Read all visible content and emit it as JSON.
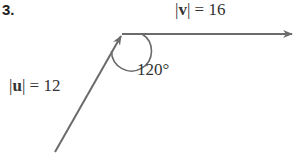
{
  "problem_number": "3.",
  "vectors": {
    "v": {
      "label": "|v| = 16",
      "name": "v",
      "magnitude": "16"
    },
    "u": {
      "label": "|u| = 12",
      "name": "u",
      "magnitude": "12"
    }
  },
  "angle": {
    "label": "120°",
    "value": 120
  },
  "colors": {
    "line": "#6b6b6b",
    "text": "#333333"
  }
}
